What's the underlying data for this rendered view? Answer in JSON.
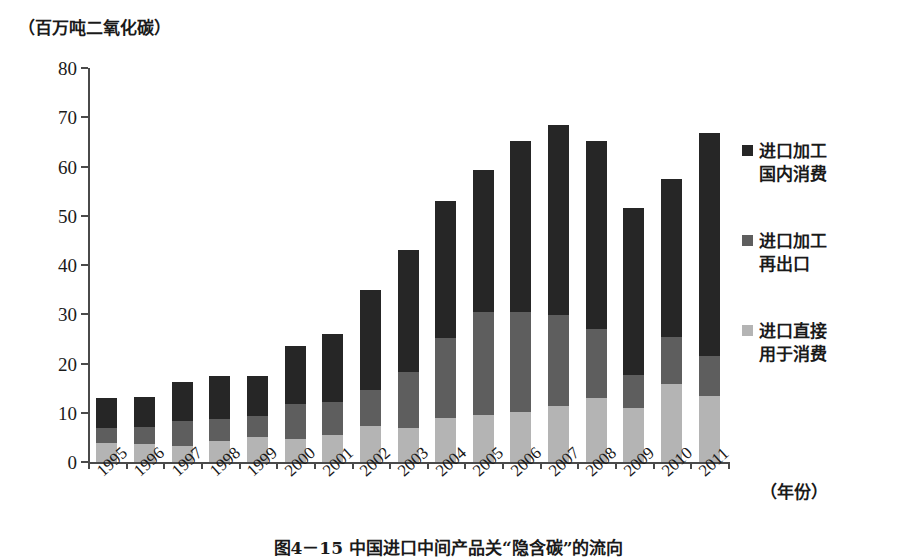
{
  "axis": {
    "y_unit_label": "（百万吨二氧化碳）",
    "x_unit_label": "（年份）",
    "y_ticks": [
      "0",
      "10",
      "20",
      "30",
      "40",
      "50",
      "60",
      "70",
      "80"
    ]
  },
  "legend": {
    "items": [
      {
        "label": "进口加工\n国内消费",
        "color": "#262626",
        "name": "legend-import-processing-domestic"
      },
      {
        "label": "进口加工\n再出口",
        "color": "#5e5e5e",
        "name": "legend-import-processing-reexport"
      },
      {
        "label": "进口直接\n用于消费",
        "color": "#b4b4b4",
        "name": "legend-import-direct-consumption"
      }
    ]
  },
  "caption": {
    "text": "图4－15  中国进口中间产品关“隐含碳”的流向"
  },
  "chart_data": {
    "type": "bar",
    "stacked": true,
    "title": "图4－15  中国进口中间产品关“隐含碳”的流向",
    "xlabel": "（年份）",
    "ylabel": "（百万吨二氧化碳）",
    "ylim": [
      0,
      80
    ],
    "ytick_step": 10,
    "grid": false,
    "legend_position": "right",
    "categories": [
      "1995",
      "1996",
      "1997",
      "1998",
      "1999",
      "2000",
      "2001",
      "2002",
      "2003",
      "2004",
      "2005",
      "2006",
      "2007",
      "2008",
      "2009",
      "2010",
      "2011"
    ],
    "series": [
      {
        "name": "进口直接用于消费",
        "color": "#b4b4b4",
        "values": [
          3.8,
          3.6,
          3.3,
          4.3,
          5.0,
          4.6,
          5.4,
          7.4,
          7.0,
          9.0,
          9.6,
          10.2,
          11.3,
          13.0,
          11.0,
          15.8,
          13.5
        ]
      },
      {
        "name": "进口加工再出口",
        "color": "#5e5e5e",
        "values": [
          3.1,
          3.5,
          5.0,
          4.4,
          4.4,
          7.2,
          6.8,
          7.3,
          11.2,
          16.2,
          20.8,
          20.2,
          18.6,
          14.0,
          6.6,
          9.6,
          8.0
        ]
      },
      {
        "name": "进口加工国内消费",
        "color": "#262626",
        "values": [
          6.1,
          6.2,
          8.0,
          8.8,
          8.1,
          11.8,
          13.8,
          20.2,
          24.8,
          27.8,
          28.8,
          34.8,
          38.5,
          38.2,
          34.0,
          32.1,
          45.4
        ]
      }
    ],
    "totals": [
      13.0,
      13.3,
      16.3,
      17.5,
      17.5,
      23.6,
      26.0,
      34.9,
      43.0,
      53.0,
      59.2,
      65.2,
      68.4,
      65.2,
      51.6,
      57.5,
      66.9
    ]
  }
}
